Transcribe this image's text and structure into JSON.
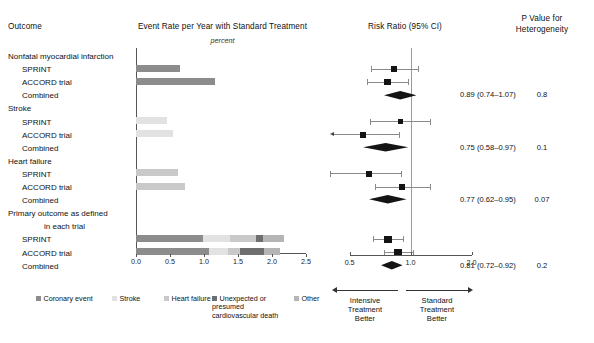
{
  "headers": {
    "outcome": "Outcome",
    "bar_panel": "Event Rate per Year with Standard Treatment",
    "bar_units": "percent",
    "forest_panel": "Risk Ratio (95% CI)",
    "p_value_line1": "P Value for",
    "p_value_line2": "Heterogeneity"
  },
  "rows": [
    {
      "label": "Nonfatal myocardial infarction",
      "type": "group"
    },
    {
      "label": "SPRINT",
      "type": "sub"
    },
    {
      "label": "ACCORD trial",
      "type": "sub"
    },
    {
      "label": "Combined",
      "type": "sub"
    },
    {
      "label": "Stroke",
      "type": "group"
    },
    {
      "label": "SPRINT",
      "type": "sub"
    },
    {
      "label": "ACCORD trial",
      "type": "sub"
    },
    {
      "label": "Combined",
      "type": "sub"
    },
    {
      "label": "Heart failure",
      "type": "group"
    },
    {
      "label": "SPRINT",
      "type": "sub"
    },
    {
      "label": "ACCORD trial",
      "type": "sub"
    },
    {
      "label": "Combined",
      "type": "sub"
    },
    {
      "label": "Primary outcome as defined",
      "type": "group"
    },
    {
      "label": "in each trial",
      "type": "cont"
    },
    {
      "label": "SPRINT",
      "type": "sub"
    },
    {
      "label": "ACCORD trial",
      "type": "sub"
    },
    {
      "label": "Combined",
      "type": "sub"
    }
  ],
  "legend": [
    {
      "label": "Coronary event",
      "color": "#8c8c8c"
    },
    {
      "label": "Stroke",
      "color": "#e2e2e2"
    },
    {
      "label": "Heart failure",
      "color": "#c9c9c9"
    },
    {
      "label": "Unexpected or presumed cardiovascular death",
      "color": "#6e6e6e"
    },
    {
      "label": "Other",
      "color": "#b5b5b5"
    }
  ],
  "footer": {
    "left_label_line1": "Intensive",
    "left_label_line2": "Treatment",
    "left_label_line3": "Better",
    "right_label_line1": "Standard",
    "right_label_line2": "Treatment",
    "right_label_line3": "Better"
  },
  "chart_data": {
    "type": "bar",
    "title": "Event Rate per Year with Standard Treatment",
    "xlabel": "percent",
    "ylabel": "",
    "xlim": [
      0.0,
      2.5
    ],
    "xticks": [
      "0.0",
      "0.5",
      "1.0",
      "1.5",
      "2.0",
      "2.5"
    ],
    "grid": false,
    "legend_position": "bottom",
    "stacked": true,
    "categories": [
      "Nonfatal myocardial infarction - SPRINT",
      "Nonfatal myocardial infarction - ACCORD trial",
      "Stroke - SPRINT",
      "Stroke - ACCORD trial",
      "Heart failure - SPRINT",
      "Heart failure - ACCORD trial",
      "Primary outcome - SPRINT",
      "Primary outcome - ACCORD trial"
    ],
    "bars": [
      {
        "category": "Nonfatal myocardial infarction - SPRINT",
        "total": 0.65,
        "segments": [
          {
            "name": "Coronary event",
            "value": 0.65,
            "color": "#8c8c8c"
          }
        ]
      },
      {
        "category": "Nonfatal myocardial infarction - ACCORD trial",
        "total": 1.16,
        "segments": [
          {
            "name": "Coronary event",
            "value": 1.16,
            "color": "#8c8c8c"
          }
        ]
      },
      {
        "category": "Stroke - SPRINT",
        "total": 0.45,
        "segments": [
          {
            "name": "Stroke",
            "value": 0.45,
            "color": "#e2e2e2"
          }
        ]
      },
      {
        "category": "Stroke - ACCORD trial",
        "total": 0.54,
        "segments": [
          {
            "name": "Stroke",
            "value": 0.54,
            "color": "#e2e2e2"
          }
        ]
      },
      {
        "category": "Heart failure - SPRINT",
        "total": 0.62,
        "segments": [
          {
            "name": "Heart failure",
            "value": 0.62,
            "color": "#c9c9c9"
          }
        ]
      },
      {
        "category": "Heart failure - ACCORD trial",
        "total": 0.72,
        "segments": [
          {
            "name": "Heart failure",
            "value": 0.72,
            "color": "#c9c9c9"
          }
        ]
      },
      {
        "category": "Primary outcome - SPRINT",
        "total": 2.17,
        "segments": [
          {
            "name": "Coronary event",
            "value": 0.98,
            "color": "#8c8c8c"
          },
          {
            "name": "Stroke",
            "value": 0.4,
            "color": "#e2e2e2"
          },
          {
            "name": "Heart failure",
            "value": 0.38,
            "color": "#c9c9c9"
          },
          {
            "name": "Unexpected or presumed cardiovascular death",
            "value": 0.11,
            "color": "#6e6e6e"
          },
          {
            "name": "Other",
            "value": 0.3,
            "color": "#b5b5b5"
          }
        ]
      },
      {
        "category": "Primary outcome - ACCORD trial",
        "total": 2.12,
        "segments": [
          {
            "name": "Coronary event",
            "value": 1.07,
            "color": "#8c8c8c"
          },
          {
            "name": "Stroke",
            "value": 0.28,
            "color": "#e2e2e2"
          },
          {
            "name": "Heart failure",
            "value": 0.18,
            "color": "#c9c9c9"
          },
          {
            "name": "Unexpected or presumed cardiovascular death",
            "value": 0.35,
            "color": "#6e6e6e"
          },
          {
            "name": "Other",
            "value": 0.24,
            "color": "#b5b5b5"
          }
        ]
      }
    ]
  },
  "forest_data": {
    "type": "forest",
    "xlabel": "Risk Ratio (95% CI)",
    "xlim": [
      0.4,
      2.2
    ],
    "xticks": [
      "0.5",
      "1.0",
      "2.0"
    ],
    "xtick_values": [
      0.5,
      1.0,
      2.0
    ],
    "reference_line": 1.0,
    "scale": "log",
    "entries": [
      {
        "outcome": "Nonfatal myocardial infarction",
        "study": "SPRINT",
        "estimate": 0.83,
        "ci_low": 0.64,
        "ci_high": 1.09,
        "marker": "square",
        "weight": 0.5
      },
      {
        "outcome": "Nonfatal myocardial infarction",
        "study": "ACCORD trial",
        "estimate": 0.77,
        "ci_low": 0.61,
        "ci_high": 0.97,
        "marker": "square",
        "weight": 0.7
      },
      {
        "outcome": "Nonfatal myocardial infarction",
        "study": "Combined",
        "estimate": 0.89,
        "ci_low": 0.74,
        "ci_high": 1.07,
        "marker": "diamond",
        "rr_text": "0.89 (0.74–1.07)",
        "p_heterogeneity": "0.8"
      },
      {
        "outcome": "Stroke",
        "study": "SPRINT",
        "estimate": 0.89,
        "ci_low": 0.63,
        "ci_high": 1.25,
        "marker": "square",
        "weight": 0.5
      },
      {
        "outcome": "Stroke",
        "study": "ACCORD trial",
        "estimate": 0.58,
        "ci_low": 0.39,
        "ci_high": 0.88,
        "marker": "square",
        "weight": 0.6
      },
      {
        "outcome": "Stroke",
        "study": "Combined",
        "estimate": 0.75,
        "ci_low": 0.58,
        "ci_high": 0.97,
        "marker": "diamond",
        "rr_text": "0.75 (0.58–0.97)",
        "p_heterogeneity": "0.1"
      },
      {
        "outcome": "Heart failure",
        "study": "SPRINT",
        "estimate": 0.62,
        "ci_low": 0.4,
        "ci_high": 0.9,
        "marker": "square",
        "weight": 0.6
      },
      {
        "outcome": "Heart failure",
        "study": "ACCORD trial",
        "estimate": 0.91,
        "ci_low": 0.67,
        "ci_high": 1.24,
        "marker": "square",
        "weight": 0.6
      },
      {
        "outcome": "Heart failure",
        "study": "Combined",
        "estimate": 0.77,
        "ci_low": 0.62,
        "ci_high": 0.95,
        "marker": "diamond",
        "rr_text": "0.77 (0.62–0.95)",
        "p_heterogeneity": "0.07"
      },
      {
        "outcome": "Primary outcome as defined in each trial",
        "study": "SPRINT",
        "estimate": 0.77,
        "ci_low": 0.65,
        "ci_high": 0.92,
        "marker": "square",
        "weight": 1.0
      },
      {
        "outcome": "Primary outcome as defined in each trial",
        "study": "ACCORD trial",
        "estimate": 0.87,
        "ci_low": 0.74,
        "ci_high": 1.03,
        "marker": "square",
        "weight": 1.0
      },
      {
        "outcome": "Primary outcome as defined in each trial",
        "study": "Combined",
        "estimate": 0.81,
        "ci_low": 0.72,
        "ci_high": 0.92,
        "marker": "diamond",
        "rr_text": "0.81 (0.72–0.92)",
        "p_heterogeneity": "0.2"
      }
    ]
  }
}
